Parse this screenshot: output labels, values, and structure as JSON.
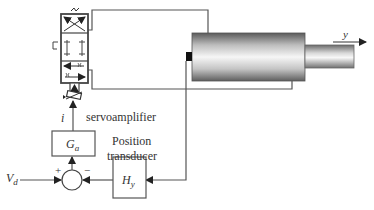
{
  "diagram": {
    "type": "block-diagram",
    "labels": {
      "output": "y",
      "current": "i",
      "servoamplifier": "servoamplifier",
      "amplifier_gain": "Ga",
      "position_line1": "Position",
      "position_line2": "transducer",
      "transducer_gain": "Hy",
      "input": "Vd",
      "plus_sign": "+",
      "minus_sign": "−"
    },
    "blocks": [
      {
        "id": "servo-valve",
        "kind": "4-way servo valve symbol"
      },
      {
        "id": "hydraulic-cylinder",
        "kind": "cylinder with piston rod"
      },
      {
        "id": "amplifier",
        "label": "Ga"
      },
      {
        "id": "transducer",
        "label": "Hy"
      },
      {
        "id": "summing-junction",
        "inputs": [
          "+Vd",
          "−Hy output"
        ]
      }
    ],
    "colors": {
      "line": "#555555",
      "cylinder_dark": "#6a6a6a",
      "cylinder_light": "#f4f4f4",
      "marker": "#111111"
    }
  }
}
